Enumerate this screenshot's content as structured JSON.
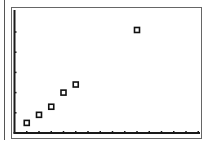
{
  "screen": {
    "description": "Graphing calculator scatter plot screen",
    "colors": {
      "background": "#ffffff",
      "axis": "#1a1a1a",
      "frame": "#666666",
      "marker": "#111111"
    }
  },
  "chart_data": {
    "type": "scatter",
    "title": "",
    "xlabel": "",
    "ylabel": "",
    "marker": "hollow-square",
    "x_ticks": 15,
    "y_ticks": 5,
    "xlim": [
      0,
      15
    ],
    "ylim": [
      0,
      5.5
    ],
    "grid": false,
    "legend": null,
    "points": [
      {
        "x": 1,
        "y": 0.5
      },
      {
        "x": 2,
        "y": 0.9
      },
      {
        "x": 3,
        "y": 1.3
      },
      {
        "x": 4,
        "y": 2.0
      },
      {
        "x": 5,
        "y": 2.4
      },
      {
        "x": 10,
        "y": 5.1
      }
    ]
  }
}
